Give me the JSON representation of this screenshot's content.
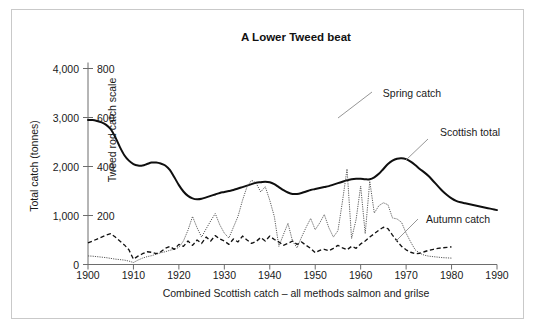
{
  "figure": {
    "title": "A Lower Tweed beat",
    "xlabel": "Combined Scottish catch – all methods salmon and grilse",
    "ylabel_left": "Total catch (tonnes)",
    "ylabel_right": "Tweed rod catch scale",
    "frame_color": "#c9c9c9",
    "background": "#ffffff"
  },
  "labels": {
    "spring": "Spring catch",
    "scottish": "Scottish total",
    "autumn": "Autumn catch"
  },
  "axis": {
    "x_ticks": [
      "1900",
      "1910",
      "1920",
      "1930",
      "1940",
      "1950",
      "1960",
      "1970",
      "1980",
      "1990"
    ],
    "y_left_ticks": [
      "0",
      "1,000",
      "2,000",
      "3,000",
      "4,000"
    ],
    "y_right_ticks": [
      "0",
      "200",
      "400",
      "600",
      "800"
    ]
  },
  "chart_data": {
    "type": "line",
    "title": "A Lower Tweed beat",
    "xlabel": "Combined Scottish catch – all methods salmon and grilse",
    "ylabel": "Total catch (tonnes)",
    "ylabel_secondary": "Tweed rod catch scale",
    "xlim": [
      1900,
      1990
    ],
    "ylim": [
      0,
      4000
    ],
    "ylim_secondary": [
      0,
      800
    ],
    "xticks": [
      1900,
      1910,
      1920,
      1930,
      1940,
      1950,
      1960,
      1970,
      1980,
      1990
    ],
    "yticks": [
      0,
      1000,
      2000,
      3000,
      4000
    ],
    "yticks_secondary": [
      0,
      200,
      400,
      600,
      800
    ],
    "grid": false,
    "legend": "inline annotations",
    "series": [
      {
        "name": "Scottish total",
        "axis": "left",
        "units": "tonnes",
        "style": "solid thick black",
        "color": "#0f0f0f",
        "x": [
          1900,
          1901,
          1902,
          1903,
          1904,
          1905,
          1906,
          1907,
          1908,
          1909,
          1910,
          1911,
          1912,
          1913,
          1914,
          1915,
          1916,
          1917,
          1918,
          1919,
          1920,
          1921,
          1922,
          1923,
          1924,
          1925,
          1926,
          1927,
          1928,
          1929,
          1930,
          1931,
          1932,
          1933,
          1934,
          1935,
          1936,
          1937,
          1938,
          1939,
          1940,
          1941,
          1942,
          1943,
          1944,
          1945,
          1946,
          1947,
          1948,
          1949,
          1950,
          1951,
          1952,
          1953,
          1954,
          1955,
          1956,
          1957,
          1958,
          1959,
          1960,
          1961,
          1962,
          1963,
          1964,
          1965,
          1966,
          1967,
          1968,
          1969,
          1970,
          1971,
          1972,
          1973,
          1974,
          1975,
          1976,
          1977,
          1978,
          1979,
          1980,
          1981,
          1982,
          1983,
          1984,
          1985,
          1986,
          1987,
          1988,
          1989,
          1990
        ],
        "values": [
          2950,
          2950,
          2930,
          2900,
          2850,
          2760,
          2600,
          2400,
          2230,
          2120,
          2050,
          2020,
          2020,
          2050,
          2080,
          2080,
          2060,
          2020,
          1930,
          1780,
          1620,
          1490,
          1400,
          1350,
          1330,
          1340,
          1370,
          1400,
          1430,
          1460,
          1480,
          1500,
          1520,
          1550,
          1580,
          1610,
          1640,
          1670,
          1680,
          1690,
          1680,
          1640,
          1580,
          1520,
          1470,
          1440,
          1440,
          1460,
          1490,
          1520,
          1540,
          1560,
          1580,
          1600,
          1630,
          1660,
          1690,
          1720,
          1740,
          1750,
          1750,
          1740,
          1740,
          1780,
          1850,
          1950,
          2050,
          2120,
          2160,
          2170,
          2150,
          2100,
          2030,
          1950,
          1880,
          1800,
          1700,
          1600,
          1500,
          1420,
          1350,
          1300,
          1270,
          1250,
          1230,
          1210,
          1190,
          1170,
          1150,
          1130,
          1110
        ]
      },
      {
        "name": "Spring catch",
        "axis": "right",
        "units": "Tweed rod catch scale",
        "style": "fine dotted",
        "color": "#5b5b5b",
        "x": [
          1900,
          1901,
          1902,
          1903,
          1904,
          1905,
          1906,
          1907,
          1908,
          1909,
          1910,
          1911,
          1912,
          1913,
          1914,
          1915,
          1916,
          1917,
          1918,
          1919,
          1920,
          1921,
          1922,
          1923,
          1924,
          1925,
          1926,
          1927,
          1928,
          1929,
          1930,
          1931,
          1932,
          1933,
          1934,
          1935,
          1936,
          1937,
          1938,
          1939,
          1940,
          1941,
          1942,
          1943,
          1944,
          1945,
          1946,
          1947,
          1948,
          1949,
          1950,
          1951,
          1952,
          1953,
          1954,
          1955,
          1956,
          1957,
          1958,
          1959,
          1960,
          1961,
          1962,
          1963,
          1964,
          1965,
          1966,
          1967,
          1968,
          1969,
          1970,
          1971,
          1972,
          1973,
          1974,
          1975,
          1976,
          1977,
          1978,
          1979,
          1980
        ],
        "values": [
          35,
          34,
          32,
          30,
          28,
          25,
          22,
          20,
          18,
          14,
          8,
          18,
          26,
          32,
          36,
          42,
          48,
          52,
          58,
          62,
          70,
          96,
          140,
          196,
          150,
          112,
          146,
          178,
          208,
          162,
          128,
          108,
          152,
          196,
          262,
          318,
          344,
          332,
          296,
          318,
          262,
          196,
          74,
          122,
          168,
          96,
          68,
          112,
          152,
          188,
          142,
          170,
          204,
          150,
          112,
          138,
          258,
          390,
          106,
          184,
          320,
          126,
          340,
          210,
          240,
          252,
          244,
          190,
          186,
          172,
          128,
          92,
          60,
          46,
          38,
          34,
          32,
          30,
          28,
          27,
          26
        ]
      },
      {
        "name": "Autumn catch",
        "axis": "right",
        "units": "Tweed rod catch scale",
        "style": "dashed",
        "color": "#121212",
        "x": [
          1900,
          1901,
          1902,
          1903,
          1904,
          1905,
          1906,
          1907,
          1908,
          1909,
          1910,
          1911,
          1912,
          1913,
          1914,
          1915,
          1916,
          1917,
          1918,
          1919,
          1920,
          1921,
          1922,
          1923,
          1924,
          1925,
          1926,
          1927,
          1928,
          1929,
          1930,
          1931,
          1932,
          1933,
          1934,
          1935,
          1936,
          1937,
          1938,
          1939,
          1940,
          1941,
          1942,
          1943,
          1944,
          1945,
          1946,
          1947,
          1948,
          1949,
          1950,
          1951,
          1952,
          1953,
          1954,
          1955,
          1956,
          1957,
          1958,
          1959,
          1960,
          1961,
          1962,
          1963,
          1964,
          1965,
          1966,
          1967,
          1968,
          1969,
          1970,
          1971,
          1972,
          1973,
          1974,
          1975,
          1976,
          1977,
          1978,
          1979,
          1980
        ],
        "values": [
          88,
          96,
          104,
          112,
          120,
          126,
          112,
          96,
          80,
          60,
          22,
          34,
          44,
          52,
          50,
          44,
          52,
          66,
          74,
          62,
          82,
          74,
          96,
          78,
          100,
          86,
          112,
          96,
          118,
          104,
          96,
          82,
          104,
          92,
          116,
          100,
          86,
          94,
          110,
          96,
          116,
          102,
          92,
          78,
          86,
          96,
          82,
          92,
          78,
          66,
          48,
          58,
          62,
          56,
          66,
          78,
          68,
          60,
          74,
          66,
          84,
          96,
          112,
          126,
          140,
          152,
          146,
          120,
          96,
          74,
          60,
          50,
          44,
          46,
          52,
          58,
          62,
          66,
          68,
          70,
          72
        ]
      }
    ]
  }
}
